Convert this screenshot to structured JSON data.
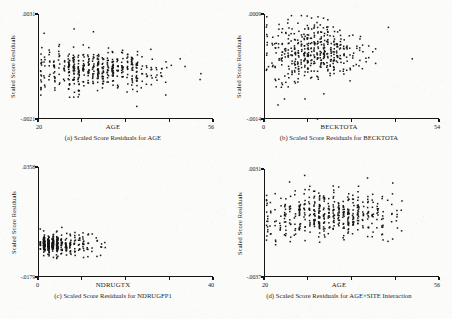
{
  "figure": {
    "shared_y_axis_title": "Scaled Score Residuals",
    "panel_count": 4,
    "ink_color": "#161616",
    "paper_color": "#fbfbfa"
  },
  "panels": [
    {
      "id": "panel-a",
      "caption": "(a) Scaled Score Residuals for AGE",
      "ytitle": "Scaled Score Residuals",
      "xtitle": "AGE",
      "ytick_labels": [
        ".0031",
        "-.0021"
      ],
      "xtick_labels": [
        "20",
        "56"
      ],
      "chart_data": {
        "type": "scatter",
        "title": "(a) Scaled Score Residuals for AGE",
        "xlabel": "AGE",
        "ylabel": "Scaled Score Residuals",
        "xlim": [
          20,
          56
        ],
        "ylim": [
          -0.0021,
          0.0031
        ],
        "xticks": [
          20,
          29,
          38,
          47,
          56
        ],
        "xtick_labels": [
          "20",
          "",
          "",
          "",
          "56"
        ],
        "yticks": [
          -0.0021,
          0.0031
        ],
        "ytick_labels": [
          "-.0021",
          ".0031"
        ],
        "grid": false,
        "legend": null,
        "n_points": 470,
        "marker": "square",
        "marker_size_px": 1.5,
        "series": [
          {
            "name": "residuals",
            "distribution": "integer-x column clusters, dense band near zero with upper-tail outliers",
            "x_mode": "integer ages, density peaking 24-40",
            "x_density_peak": 32,
            "y_center": 0.0004,
            "y_spread": 0.00055,
            "seed": 1301
          }
        ]
      }
    },
    {
      "id": "panel-b",
      "caption": "(b) Scaled Score Residuals for BECKTOTA",
      "ytitle": "Scaled Score Residuals",
      "xtitle": "BECKTOTA",
      "ytick_labels": [
        ".0009",
        "-.0014"
      ],
      "xtick_labels": [
        "0",
        "54"
      ],
      "chart_data": {
        "type": "scatter",
        "title": "(b) Scaled Score Residuals for BECKTOTA",
        "xlabel": "BECKTOTA",
        "ylabel": "Scaled Score Residuals",
        "xlim": [
          0,
          54
        ],
        "ylim": [
          -0.0014,
          0.0009
        ],
        "xticks": [
          0,
          13.5,
          27,
          40.5,
          54
        ],
        "xtick_labels": [
          "0",
          "",
          "",
          "",
          "54"
        ],
        "yticks": [
          -0.0014,
          0.0009
        ],
        "ytick_labels": [
          "-.0014",
          ".0009"
        ],
        "grid": false,
        "legend": null,
        "n_points": 470,
        "marker": "square",
        "marker_size_px": 1.5,
        "series": [
          {
            "name": "residuals",
            "distribution": "integer-x column clusters, funnel narrowing mid-range then widening",
            "x_mode": "integer scores, density peaking 6-22",
            "x_density_peak": 14,
            "y_center": 0.0001,
            "y_spread": 0.00035,
            "seed": 2207
          }
        ]
      }
    },
    {
      "id": "panel-c",
      "caption": "(c) Scaled Score Residuals for NDRUGFP1",
      "ytitle": "Scaled Score Residuals",
      "xtitle": "NDRUGTX",
      "ytick_labels": [
        ".0358",
        "-.0179"
      ],
      "xtick_labels": [
        "0",
        "40"
      ],
      "chart_data": {
        "type": "scatter",
        "title": "(c) Scaled Score Residuals for NDRUGFP1",
        "xlabel": "NDRUGTX",
        "ylabel": "Scaled Score Residuals",
        "xlim": [
          0,
          40
        ],
        "ylim": [
          -0.0179,
          0.0358
        ],
        "xticks": [
          0,
          10,
          20,
          30,
          40
        ],
        "xtick_labels": [
          "0",
          "",
          "",
          "",
          "40"
        ],
        "yticks": [
          -0.0179,
          0.0358
        ],
        "ytick_labels": [
          "-.0179",
          ".0358"
        ],
        "grid": false,
        "legend": null,
        "n_points": 470,
        "marker": "square",
        "marker_size_px": 1.5,
        "series": [
          {
            "name": "residuals",
            "distribution": "heavy left concentration at x=0-6, long sparse right tail",
            "x_mode": "integer counts, strongly right-skewed",
            "x_density_peak": 1,
            "y_center": -0.0015,
            "y_spread": 0.0032,
            "seed": 3319
          }
        ]
      }
    },
    {
      "id": "panel-d",
      "caption": "(d) Scaled Score Residuals for AGE×SITE Interaction",
      "ytitle": "Scaled Score Residuals",
      "xtitle": "AGE",
      "ytick_labels": [
        ".0031",
        "-.0037"
      ],
      "xtick_labels": [
        "20",
        "56"
      ],
      "chart_data": {
        "type": "scatter",
        "title": "(d) Scaled Score Residuals for AGE×SITE Interaction",
        "xlabel": "AGE",
        "ylabel": "Scaled Score Residuals",
        "xlim": [
          20,
          56
        ],
        "ylim": [
          -0.0037,
          0.0031
        ],
        "xticks": [
          20,
          29,
          38,
          47,
          56
        ],
        "xtick_labels": [
          "20",
          "",
          "",
          "",
          "56"
        ],
        "yticks": [
          -0.0037,
          0.0031
        ],
        "ytick_labels": [
          "-.0037",
          ".0031"
        ],
        "grid": false,
        "legend": null,
        "n_points": 470,
        "marker": "square",
        "marker_size_px": 1.5,
        "series": [
          {
            "name": "residuals",
            "distribution": "integer-x column clusters, broad vertical spread across ages",
            "x_mode": "integer ages, density peaking 24-42",
            "x_density_peak": 33,
            "y_center": 0.0003,
            "y_spread": 0.00085,
            "seed": 4421
          }
        ]
      }
    }
  ]
}
